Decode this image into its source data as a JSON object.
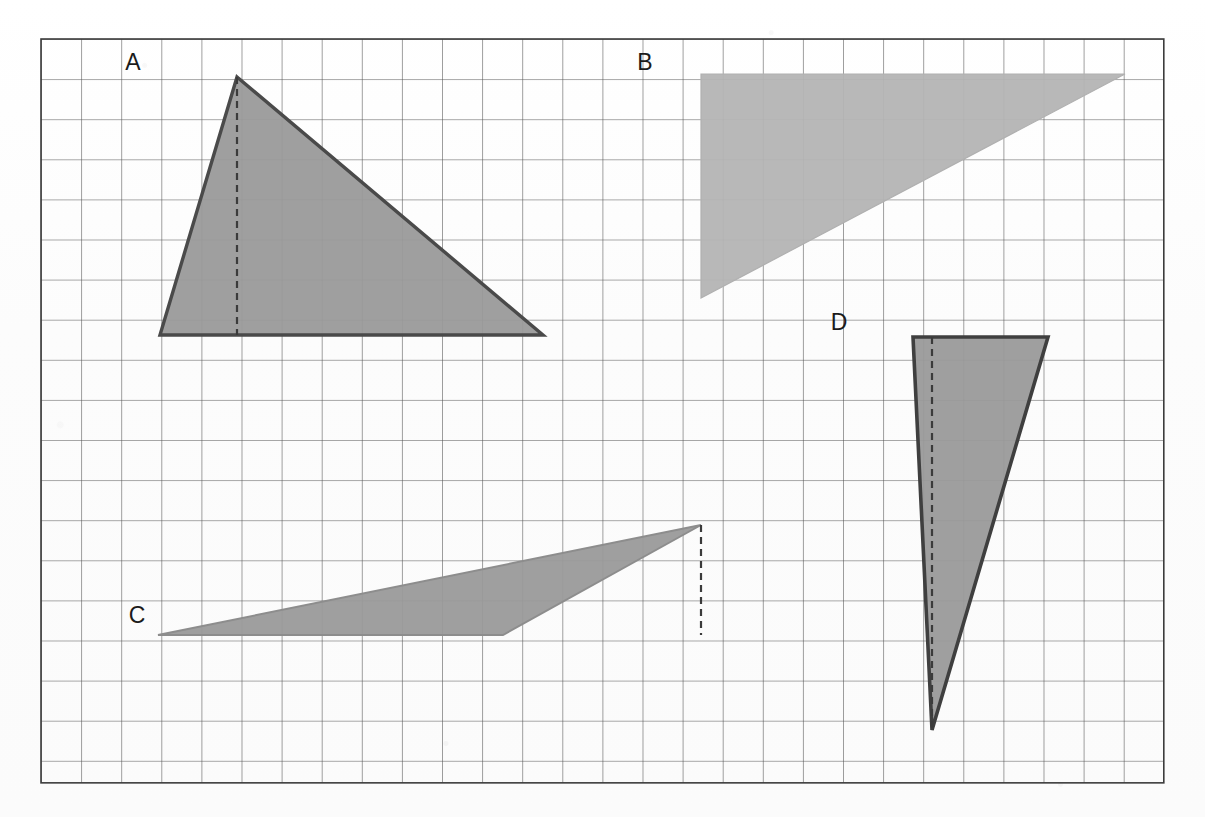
{
  "figure": {
    "background_color": "#fdfdfd",
    "grid": {
      "origin_x": 41,
      "origin_y": 39,
      "cell_size": 40.1,
      "columns": 28,
      "rows": 18.55,
      "line_color": "#4f4f4f",
      "line_width": 1.1,
      "border_color": "#3c3c3c",
      "border_width": 1.6
    },
    "shapes": [
      {
        "id": "triangle-a",
        "label": "A",
        "label_x": 133,
        "label_y": 70,
        "fill": "#9a9a9a",
        "fill_opacity": 0.95,
        "stroke": "#4a4a4a",
        "stroke_width": 3.4,
        "points": "237,77 543,335 160,335",
        "dashed_height_line": {
          "x1": 237,
          "y1": 77,
          "x2": 237,
          "y2": 335
        },
        "base_cells": 9.6,
        "height_cells": 6.4
      },
      {
        "id": "triangle-b",
        "label": "B",
        "label_x": 645,
        "label_y": 70,
        "fill": "#b4b4b4",
        "fill_opacity": 0.95,
        "stroke": "#b0b0b0",
        "stroke_width": 1.2,
        "points": "701,74 1125,74 701,298",
        "dashed_height_line": null,
        "base_cells": 10.6,
        "height_cells": 5.6
      },
      {
        "id": "triangle-c",
        "label": "C",
        "label_x": 137,
        "label_y": 623,
        "fill": "#9a9a9a",
        "fill_opacity": 0.95,
        "stroke": "#8d8d8d",
        "stroke_width": 2.0,
        "points": "158,635 503,635 701,525",
        "dashed_height_line": {
          "x1": 701,
          "y1": 525,
          "x2": 701,
          "y2": 635
        },
        "base_cells": 8.6,
        "height_cells": 2.75
      },
      {
        "id": "triangle-d",
        "label": "D",
        "label_x": 839,
        "label_y": 330,
        "fill": "#9a9a9a",
        "fill_opacity": 0.95,
        "stroke": "#3f3f3f",
        "stroke_width": 3.6,
        "points": "913,337 1048,337 932,730",
        "dashed_height_line": {
          "x1": 932,
          "y1": 337,
          "x2": 932,
          "y2": 730
        },
        "base_cells": 3.4,
        "height_cells": 9.8
      }
    ],
    "dash_pattern": "7,5",
    "dash_color": "#3b3b3b",
    "dash_width": 2.2
  }
}
